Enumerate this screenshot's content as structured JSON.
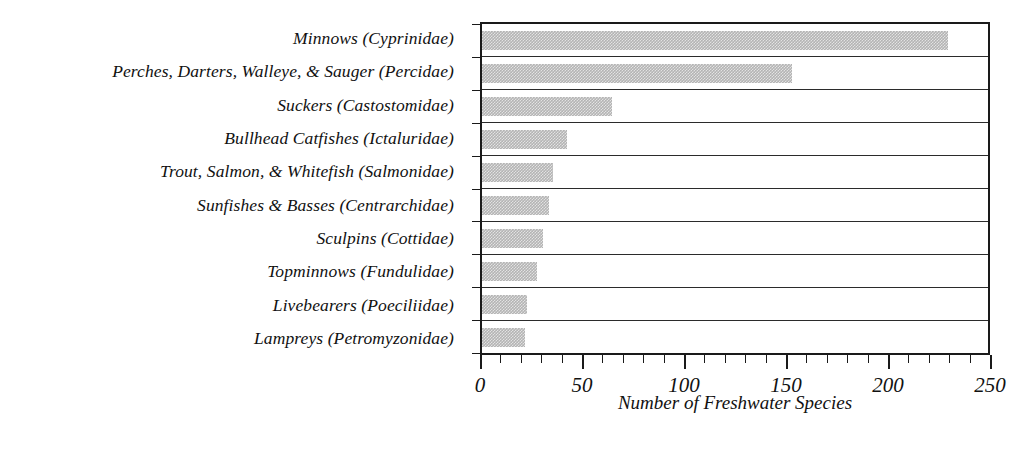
{
  "chart_data": {
    "type": "bar",
    "orientation": "horizontal",
    "title": "",
    "xlabel": "Number of Freshwater Species",
    "ylabel": "",
    "xlim": [
      0,
      250
    ],
    "xticks": [
      0,
      50,
      100,
      150,
      200,
      250
    ],
    "xtick_labels": [
      "0",
      "50",
      "100",
      "150",
      "200",
      "250"
    ],
    "minor_tick_interval": 10,
    "grid": false,
    "legend": null,
    "bar_color": "#b4b4b4",
    "categories": [
      "Minnows (Cyprinidae)",
      "Perches, Darters, Walleye, & Sauger (Percidae)",
      "Suckers (Castostomidae)",
      "Bullhead Catfishes (Ictaluridae)",
      "Trout, Salmon, & Whitefish (Salmonidae)",
      "Sunfishes & Basses (Centrarchidae)",
      "Sculpins (Cottidae)",
      "Topminnows (Fundulidae)",
      "Livebearers (Poeciliidae)",
      "Lampreys (Petromyzonidae)"
    ],
    "values": [
      230,
      153,
      64,
      42,
      35,
      33,
      30,
      27,
      22,
      21
    ]
  }
}
